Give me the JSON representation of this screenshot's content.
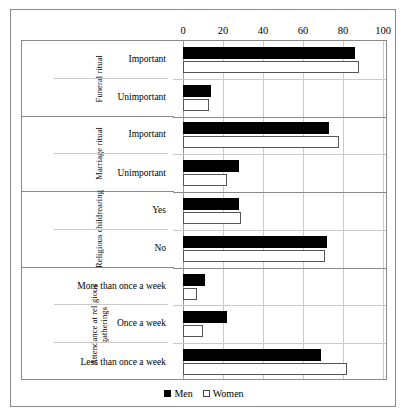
{
  "chart_data": {
    "type": "bar",
    "orientation": "horizontal",
    "title": "",
    "xlabel": "",
    "ylabel": "",
    "xlim": [
      0,
      100
    ],
    "xticks": [
      0,
      20,
      40,
      60,
      80,
      100
    ],
    "grid": true,
    "legend_position": "bottom",
    "series": [
      {
        "name": "Men",
        "color": "#000000",
        "values": [
          86,
          14,
          73,
          28,
          28,
          72,
          11,
          22,
          69
        ]
      },
      {
        "name": "Women",
        "color": "#ffffff",
        "values": [
          88,
          13,
          78,
          22,
          29,
          71,
          7,
          10,
          82
        ]
      }
    ],
    "groups": [
      {
        "name": "Funeral ritual",
        "categories": [
          "Important",
          "Unimportant"
        ],
        "men": [
          86,
          14
        ],
        "women": [
          88,
          13
        ]
      },
      {
        "name": "Marriage ritual",
        "categories": [
          "Important",
          "Unimportant"
        ],
        "men": [
          73,
          28
        ],
        "women": [
          78,
          22
        ]
      },
      {
        "name": "Religious childrearing",
        "categories": [
          "Yes",
          "No"
        ],
        "men": [
          28,
          72
        ],
        "women": [
          29,
          71
        ]
      },
      {
        "name": "Attendance at religious gatherings",
        "categories": [
          "More than once a week",
          "Once a week",
          "Less than once a week"
        ],
        "men": [
          11,
          22,
          69
        ],
        "women": [
          7,
          10,
          82
        ]
      }
    ]
  },
  "axis": {
    "ticks": [
      "0",
      "20",
      "40",
      "60",
      "80",
      "100"
    ]
  },
  "groups": [
    {
      "title": "Funeral ritual",
      "categories": [
        {
          "label": "Important",
          "men": 86,
          "women": 88
        },
        {
          "label": "Unimportant",
          "men": 14,
          "women": 13
        }
      ]
    },
    {
      "title": "Marriage ritual",
      "categories": [
        {
          "label": "Important",
          "men": 73,
          "women": 78
        },
        {
          "label": "Unimportant",
          "men": 28,
          "women": 22
        }
      ]
    },
    {
      "title": "Religious childrearing",
      "categories": [
        {
          "label": "Yes",
          "men": 28,
          "women": 29
        },
        {
          "label": "No",
          "men": 72,
          "women": 71
        }
      ]
    },
    {
      "title": "Attendance at religious gatherings",
      "categories": [
        {
          "label": "More than once a week",
          "men": 11,
          "women": 7
        },
        {
          "label": "Once a week",
          "men": 22,
          "women": 10
        },
        {
          "label": "Less than once a week",
          "men": 69,
          "women": 82
        }
      ]
    }
  ],
  "legend": {
    "men_label": "Men",
    "women_label": "Women"
  }
}
